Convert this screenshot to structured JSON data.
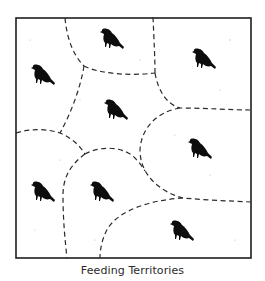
{
  "figure": {
    "caption": "Feeding Territories",
    "frame": {
      "x1": 16,
      "y1": 18,
      "x2": 251,
      "y2": 258
    },
    "colors": {
      "ink": "#0d0d0d",
      "background": "#ffffff"
    },
    "territory_count": 8,
    "birds": [
      {
        "id": "bird-top-left",
        "x": 42,
        "y": 76
      },
      {
        "id": "bird-top-center",
        "x": 111,
        "y": 40
      },
      {
        "id": "bird-top-right",
        "x": 203,
        "y": 60
      },
      {
        "id": "bird-middle-center",
        "x": 115,
        "y": 111
      },
      {
        "id": "bird-middle-right",
        "x": 199,
        "y": 150
      },
      {
        "id": "bird-bottom-left",
        "x": 42,
        "y": 193
      },
      {
        "id": "bird-bottom-center",
        "x": 101,
        "y": 193
      },
      {
        "id": "bird-bottom-right",
        "x": 181,
        "y": 232
      }
    ]
  }
}
